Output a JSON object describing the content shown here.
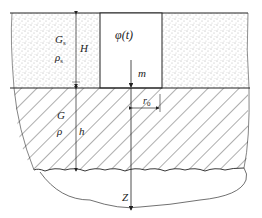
{
  "figure": {
    "labels": {
      "upper_shear_modulus": "G",
      "upper_shear_modulus_sub": "s",
      "upper_density": "ρ",
      "upper_density_sub": "s",
      "upper_thickness": "H",
      "excitation": "φ(t)",
      "mass": "m",
      "lower_shear_modulus": "G",
      "lower_density": "ρ",
      "lower_thickness": "h",
      "radius": "r",
      "radius_sub": "0",
      "depth_axis": "Z"
    },
    "colors": {
      "line": "#222222",
      "stipple": "#555555",
      "hatch": "#333333",
      "background": "#ffffff"
    }
  }
}
